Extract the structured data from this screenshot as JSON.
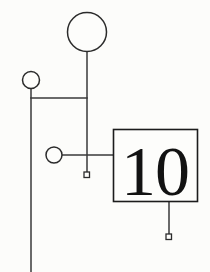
{
  "diagram": {
    "background_color": "#fcfcfa",
    "line_color": "#3a3a3a",
    "node_fill": "#fdfdfb",
    "node_stroke": "#2b2b2b",
    "box_number": "10",
    "box_number_color": "#121212",
    "nodes": [
      {
        "id": "top-circle",
        "shape": "circle",
        "label": "",
        "cx": 87,
        "cy": 32,
        "r": 19.5
      },
      {
        "id": "left-circle",
        "shape": "circle",
        "label": "",
        "cx": 31,
        "cy": 80,
        "r": 8.5
      },
      {
        "id": "middle-circle",
        "shape": "circle",
        "label": "",
        "cx": 54,
        "cy": 155,
        "r": 8.0
      },
      {
        "id": "upper-square",
        "shape": "square",
        "label": "",
        "x": 84,
        "y": 172,
        "size": 5.5
      },
      {
        "id": "lower-square",
        "shape": "square",
        "label": "",
        "x": 166,
        "y": 234,
        "size": 5.5
      },
      {
        "id": "numbered-box",
        "shape": "rect",
        "label": "10",
        "x": 113,
        "y": 129,
        "width": 85,
        "height": 73
      }
    ],
    "connectors": [
      {
        "id": "top-circle-stem",
        "from": "top-circle",
        "to": "upper-square",
        "path": "M87,52 L87,172"
      },
      {
        "id": "left-circle-stem",
        "from": "left-circle",
        "to": "sibling-bar",
        "path": "M31,88.5 L31,272"
      },
      {
        "id": "sibling-bar",
        "from": "left-circle-stem",
        "to": "top-circle-stem",
        "path": "M31,98 L87,98"
      },
      {
        "id": "union-bar",
        "from": "middle-circle",
        "to": "numbered-box",
        "path": "M62,155 L113,155"
      },
      {
        "id": "box-descender",
        "from": "numbered-box",
        "to": "lower-square",
        "path": "M169,202 L169,234"
      }
    ]
  }
}
